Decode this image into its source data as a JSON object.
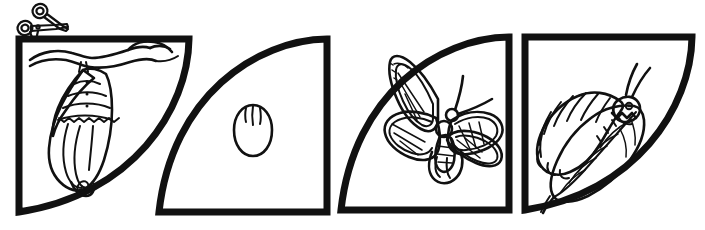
{
  "worksheet": {
    "title": "Butterfly Life Cycle Cut-Out Worksheet",
    "type": "line-art-coloring-cutout",
    "background_color": "#ffffff",
    "ink_color": "#111111",
    "width": 705,
    "height": 230,
    "text_content": "none",
    "cut_marker": {
      "icon": "scissors-icon",
      "label": "Cut along the line",
      "x": 40,
      "y": 18
    },
    "panels": [
      {
        "index": 1,
        "name": "chrysalis-panel",
        "subject": "chrysalis",
        "subject_label": "Chrysalis hanging from a branch",
        "stage": "Pupa",
        "shape": "quarter-circle",
        "curve_side": "right",
        "x": 16,
        "y": 36,
        "width": 176,
        "height": 179,
        "details": [
          "tree branch across top",
          "banded chrysalis with three ridge lines",
          "three small dots on upper bands",
          "pointed cremaster tip at bottom"
        ]
      },
      {
        "index": 2,
        "name": "egg-panel",
        "subject": "egg",
        "subject_label": "Butterfly egg",
        "stage": "Egg",
        "shape": "quarter-circle",
        "curve_side": "left",
        "x": 156,
        "y": 36,
        "width": 174,
        "height": 179,
        "details": [
          "single oval egg centered",
          "three short vertical ridge lines at top of egg"
        ]
      },
      {
        "index": 3,
        "name": "butterfly-panel",
        "subject": "butterfly",
        "subject_label": "Adult monarch butterfly",
        "stage": "Adult",
        "shape": "quarter-circle",
        "curve_side": "left",
        "x": 338,
        "y": 34,
        "width": 174,
        "height": 181,
        "details": [
          "four veined wings",
          "two curved antennae",
          "segmented body with round head and thorax"
        ]
      },
      {
        "index": 4,
        "name": "caterpillar-panel",
        "subject": "caterpillar",
        "subject_label": "Caterpillar eating a leaf",
        "stage": "Larva",
        "shape": "quarter-circle",
        "curve_side": "right",
        "x": 522,
        "y": 34,
        "width": 173,
        "height": 181,
        "details": [
          "segmented caterpillar body",
          "two antennae and an eye",
          "leaf with central vein and side veins",
          "bite taken out of leaf edge"
        ]
      }
    ]
  }
}
